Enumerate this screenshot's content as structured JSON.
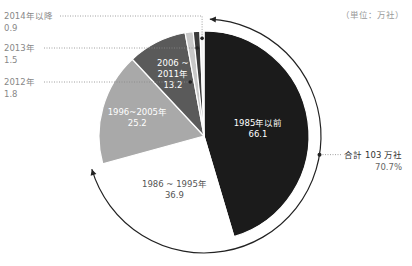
{
  "chart_data": {
    "type": "pie",
    "title": "",
    "unit_label": "（単位：万社）",
    "start": "top",
    "direction": "clockwise",
    "slices": [
      {
        "label": "1985年以前",
        "value": 66.1,
        "color": "#1b1b1b",
        "text_color": "#ffffff"
      },
      {
        "label": "1986 ~ 1995年",
        "value": 36.9,
        "color": "#ffffff",
        "text_color": "#555555"
      },
      {
        "label": "1996~2005年",
        "value": 25.2,
        "color": "#a9a9a9",
        "text_color": "#ffffff"
      },
      {
        "label": "2006 ~ 2011年",
        "value": 13.2,
        "color": "#5a5a5a",
        "text_color": "#ffffff"
      },
      {
        "label": "2012年",
        "value": 1.8,
        "color": "#c8c8c8",
        "text_color": "#777777"
      },
      {
        "label": "2013年",
        "value": 1.5,
        "color": "#3a3a3a",
        "text_color": "#777777"
      },
      {
        "label": "2014年以降",
        "value": 0.9,
        "color": "#f2f2f2",
        "text_color": "#777777"
      }
    ],
    "inside_labels": [
      {
        "slice": 0,
        "lines": [
          "1985年以前",
          "66.1"
        ]
      },
      {
        "slice": 1,
        "lines": [
          "1986 ~ 1995年",
          "36.9"
        ]
      },
      {
        "slice": 2,
        "lines": [
          "1996~2005年",
          "25.2"
        ]
      },
      {
        "slice": 3,
        "lines": [
          "2006 ~",
          "2011年",
          "13.2"
        ]
      }
    ],
    "outside_labels": [
      {
        "slice": 6,
        "lines": [
          "2014年以降",
          "0.9"
        ]
      },
      {
        "slice": 5,
        "lines": [
          "2013年",
          "1.5"
        ]
      },
      {
        "slice": 4,
        "lines": [
          "2012年",
          "1.8"
        ]
      }
    ],
    "annotation": {
      "lines": [
        "合計 103 万社",
        "70.7%"
      ],
      "covers_slices": [
        0,
        1
      ]
    }
  }
}
